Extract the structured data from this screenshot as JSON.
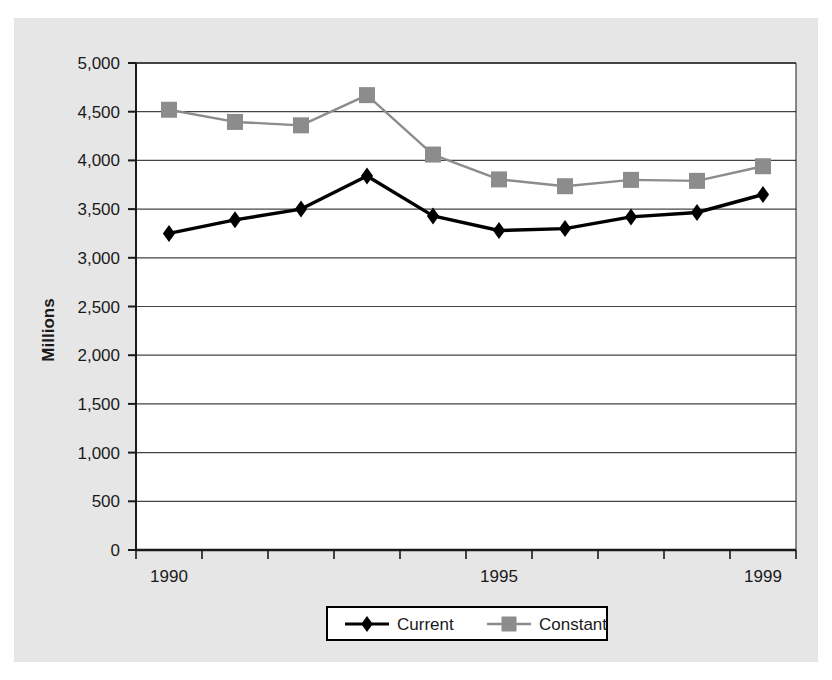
{
  "chart_data": {
    "type": "line",
    "title": "",
    "xlabel": "",
    "ylabel": "Millions",
    "categories": [
      "1990",
      "1991",
      "1992",
      "1993",
      "1994",
      "1995",
      "1996",
      "1997",
      "1998",
      "1999"
    ],
    "x_tick_labels_shown": [
      "1990",
      "1995",
      "1999"
    ],
    "ylim": [
      0,
      5000
    ],
    "y_tick_labels": [
      "0",
      "500",
      "1,000",
      "1,500",
      "2,000",
      "2,500",
      "3,000",
      "3,500",
      "4,000",
      "4,500",
      "5,000"
    ],
    "y_tick_values": [
      0,
      500,
      1000,
      1500,
      2000,
      2500,
      3000,
      3500,
      4000,
      4500,
      5000
    ],
    "grid": "horizontal",
    "legend_position": "bottom-center",
    "series": [
      {
        "name": "Current",
        "marker": "diamond",
        "color": "#000000",
        "values": [
          3250,
          3390,
          3500,
          3840,
          3430,
          3280,
          3300,
          3420,
          3465,
          3650
        ]
      },
      {
        "name": "Constant",
        "marker": "square",
        "color": "#8c8c8c",
        "values": [
          4520,
          4395,
          4360,
          4670,
          4060,
          3805,
          3735,
          3800,
          3790,
          3940
        ]
      }
    ]
  },
  "legend": {
    "items": [
      {
        "label": "Current"
      },
      {
        "label": "Constant"
      }
    ]
  },
  "colors": {
    "current_series": "#000000",
    "constant_series": "#8c8c8c",
    "plot_background": "#ffffff",
    "plate_background": "#e6e6e6",
    "gridline": "#444444",
    "axis": "#1a1a1a"
  }
}
